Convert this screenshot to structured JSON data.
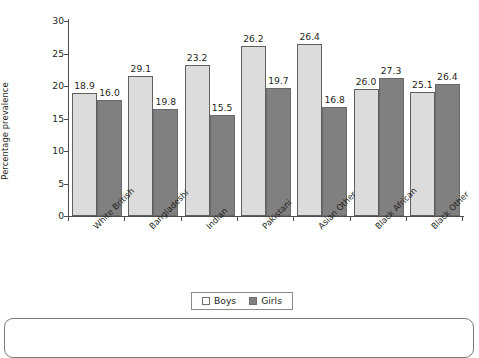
{
  "chart_data": {
    "type": "bar",
    "title": "",
    "subtitle": "",
    "xlabel": "",
    "ylabel": "Percentage prevalence",
    "ylim": [
      0,
      30
    ],
    "ytick_step": 5,
    "yticks": [
      "30",
      "25",
      "20",
      "15",
      "10",
      "5",
      "0"
    ],
    "grid": false,
    "legend_position": "bottom-center",
    "categories": [
      "White British",
      "Bangladeshi",
      "Indian",
      "Pakistani",
      "Asian Other",
      "Black African",
      "Black Other"
    ],
    "series": [
      {
        "name": "Boys",
        "color": "#dcdcdc",
        "labels": [
          "18.9",
          "29.1",
          "23.2",
          "26.2",
          "26.4",
          "26.0",
          "25.1"
        ],
        "values": [
          18.9,
          21.5,
          23.2,
          26.2,
          26.4,
          19.5,
          19.1
        ]
      },
      {
        "name": "Girls",
        "color": "#808080",
        "labels": [
          "16.0",
          "19.8",
          "15.5",
          "19.7",
          "16.8",
          "27.3",
          "26.4"
        ],
        "values": [
          17.8,
          16.5,
          15.5,
          19.7,
          16.8,
          21.2,
          20.3
        ]
      }
    ]
  },
  "legend": {
    "items": [
      {
        "label": "Boys",
        "swatch": "light-grey"
      },
      {
        "label": "Girls",
        "swatch": "dark-grey"
      }
    ]
  },
  "colors": {
    "boys_fill": "#dcdcdc",
    "girls_fill": "#808080",
    "axis": "#4d4d4d",
    "text": "#231f20",
    "frame": "#7a7a7a",
    "background": "#ffffff"
  }
}
